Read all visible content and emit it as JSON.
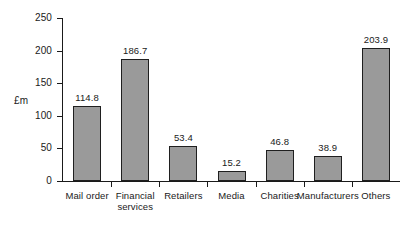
{
  "chart_data": {
    "type": "bar",
    "title": "",
    "subtitle": "",
    "xlabel": "",
    "ylabel": "£m",
    "ylim": [
      0,
      250
    ],
    "ytick_labels": [
      "250",
      "200",
      "150",
      "100",
      "50",
      "0"
    ],
    "yticks": [
      250,
      200,
      150,
      100,
      50,
      0
    ],
    "grid": false,
    "legend": null,
    "categories": [
      "Mail order",
      "Financial\nservices",
      "Retailers",
      "Media",
      "Charities",
      "Manufacturers",
      "Others"
    ],
    "values": [
      114.8,
      186.7,
      53.4,
      15.2,
      46.8,
      38.9,
      203.9
    ],
    "value_labels": [
      "114.8",
      "186.7",
      "53.4",
      "15.2",
      "46.8",
      "38.9",
      "203.9"
    ],
    "bar_fill_color": "#9a9a9a",
    "bar_edge_color": "#1f1f1f",
    "axis_color": "#1a1a1a",
    "background_color": "#ffffff"
  }
}
